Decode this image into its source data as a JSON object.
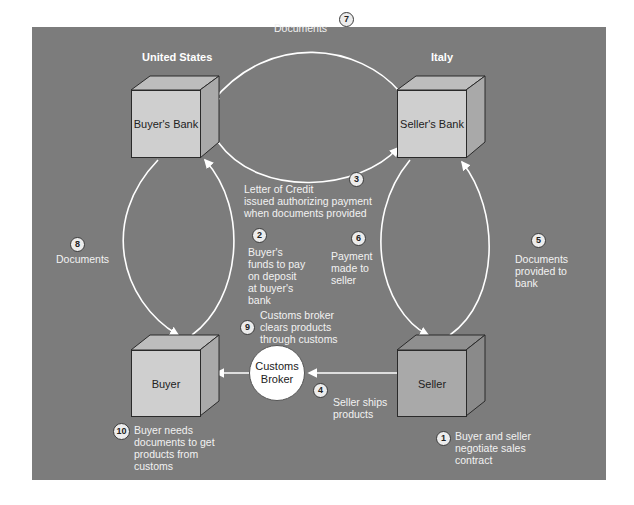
{
  "regions": {
    "left": "United States",
    "right": "Italy"
  },
  "nodes": {
    "buyers_bank": "Buyer's Bank",
    "sellers_bank": "Seller's Bank",
    "buyer": "Buyer",
    "seller": "Seller",
    "customs_broker": "Customs Broker"
  },
  "steps": [
    {
      "n": "1",
      "text": [
        "Buyer and seller",
        "negotiate sales",
        "contract"
      ]
    },
    {
      "n": "2",
      "text": [
        "Buyer's",
        "funds to pay",
        "on deposit",
        "at buyer's",
        "bank"
      ]
    },
    {
      "n": "3",
      "text": [
        "Letter of Credit",
        "issued authorizing payment",
        "when documents provided"
      ]
    },
    {
      "n": "4",
      "text": [
        "Seller ships",
        "products"
      ]
    },
    {
      "n": "5",
      "text": [
        "Documents",
        "provided to",
        "bank"
      ]
    },
    {
      "n": "6",
      "text": [
        "Payment",
        "made to",
        "seller"
      ]
    },
    {
      "n": "7",
      "text": [
        "Documents"
      ]
    },
    {
      "n": "8",
      "text": [
        "Documents"
      ]
    },
    {
      "n": "9",
      "text": [
        "Customs broker",
        "clears products",
        "through customs"
      ]
    },
    {
      "n": "10",
      "text": [
        "Buyer needs",
        "documents to get",
        "products from",
        "customs"
      ]
    }
  ],
  "colors": {
    "panel": "#7c7c7c",
    "box_light": "#cfcfcf",
    "box_dark": "#a9a9a9",
    "arrow": "#ffffff"
  }
}
